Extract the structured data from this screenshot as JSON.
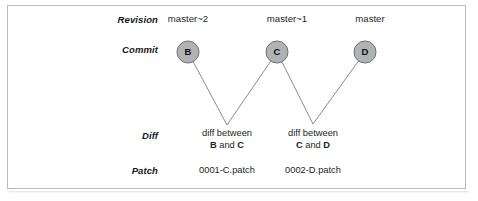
{
  "figure": {
    "frame_border_color": "#b9bcbe",
    "background_color": "#ffffff"
  },
  "row_labels": {
    "revision": "Revision",
    "commit": "Commit",
    "diff": "Diff",
    "patch": "Patch"
  },
  "revisions": [
    {
      "id": "b",
      "label": "master~2"
    },
    {
      "id": "c",
      "label": "master~1"
    },
    {
      "id": "d",
      "label": "master"
    }
  ],
  "commits": [
    {
      "id": "b",
      "letter": "B",
      "cx": 188,
      "cy": 52,
      "r": 11
    },
    {
      "id": "c",
      "letter": "C",
      "cx": 277,
      "cy": 52,
      "r": 11
    },
    {
      "id": "d",
      "letter": "D",
      "cx": 365,
      "cy": 52,
      "r": 11
    }
  ],
  "node_style": {
    "fill": "#b0b2b4",
    "stroke": "#6e7173",
    "letter_color": "#0d0f10"
  },
  "connectors": {
    "stroke": "#7b7e80",
    "stroke_width": 0.9,
    "paths": [
      {
        "id": "b-to-diff1",
        "from_commit": "b",
        "apex_x": 227,
        "apex_y": 125
      },
      {
        "id": "c-to-diff1",
        "from_commit": "c",
        "apex_x": 227,
        "apex_y": 125
      },
      {
        "id": "c-to-diff2",
        "from_commit": "c",
        "apex_x": 313,
        "apex_y": 124
      },
      {
        "id": "d-to-diff2",
        "from_commit": "d",
        "apex_x": 313,
        "apex_y": 124
      }
    ]
  },
  "diffs": [
    {
      "id": "diff1",
      "line1": "diff between",
      "left_operand": "B",
      "conjunction": " and ",
      "right_operand": "C"
    },
    {
      "id": "diff2",
      "line1": "diff between",
      "left_operand": "C",
      "conjunction": " and ",
      "right_operand": "D"
    }
  ],
  "patches": [
    {
      "id": "patch1",
      "label": "0001-C.patch"
    },
    {
      "id": "patch2",
      "label": "0002-D.patch"
    }
  ]
}
